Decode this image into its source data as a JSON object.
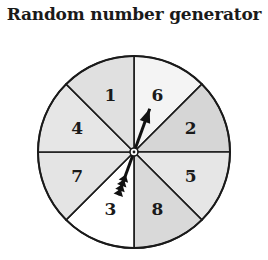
{
  "title": "Random number generator",
  "spinner": {
    "center": [
      134,
      152
    ],
    "radius": 96,
    "sectors": [
      {
        "label": "6",
        "start_deg": 0,
        "end_deg": 45,
        "fill": "#f4f4f4"
      },
      {
        "label": "2",
        "start_deg": 45,
        "end_deg": 90,
        "fill": "#d6d6d6"
      },
      {
        "label": "5",
        "start_deg": 90,
        "end_deg": 135,
        "fill": "#e6e6e6"
      },
      {
        "label": "8",
        "start_deg": 135,
        "end_deg": 180,
        "fill": "#d9d9d9"
      },
      {
        "label": "3",
        "start_deg": 180,
        "end_deg": 225,
        "fill": "#ffffff"
      },
      {
        "label": "7",
        "start_deg": 225,
        "end_deg": 270,
        "fill": "#e4e4e4"
      },
      {
        "label": "4",
        "start_deg": 270,
        "end_deg": 315,
        "fill": "#e6e6e6"
      },
      {
        "label": "1",
        "start_deg": 315,
        "end_deg": 360,
        "fill": "#e0e0e0"
      }
    ],
    "arrow": {
      "points_to": "6",
      "angle_deg": 20,
      "color": "#111111"
    }
  }
}
